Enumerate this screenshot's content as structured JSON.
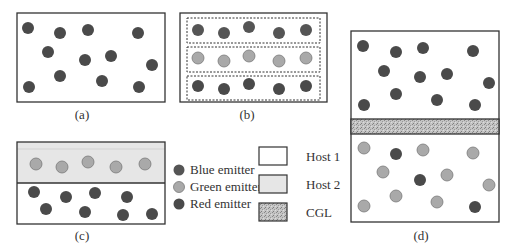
{
  "colors": {
    "red_emitter": "#4a4a4a",
    "blue_emitter": "#555555",
    "green_emitter": "#a9a9a9",
    "green_stroke": "#7a7a7a",
    "host1": "#ffffff",
    "host2": "#e6e6e6",
    "cgl": "#b5b5b5",
    "frame": "#333333"
  },
  "panels": {
    "a": {
      "caption": "(a)"
    },
    "b": {
      "caption": "(b)"
    },
    "c": {
      "caption": "(c)"
    },
    "d": {
      "caption": "(d)"
    }
  },
  "legend": {
    "emitters": [
      {
        "label": "Blue emitter"
      },
      {
        "label": "Green emitter"
      },
      {
        "label": "Red emitter"
      }
    ],
    "hosts": [
      {
        "label": "Host 1"
      },
      {
        "label": "Host 2"
      },
      {
        "label": "CGL"
      }
    ]
  }
}
